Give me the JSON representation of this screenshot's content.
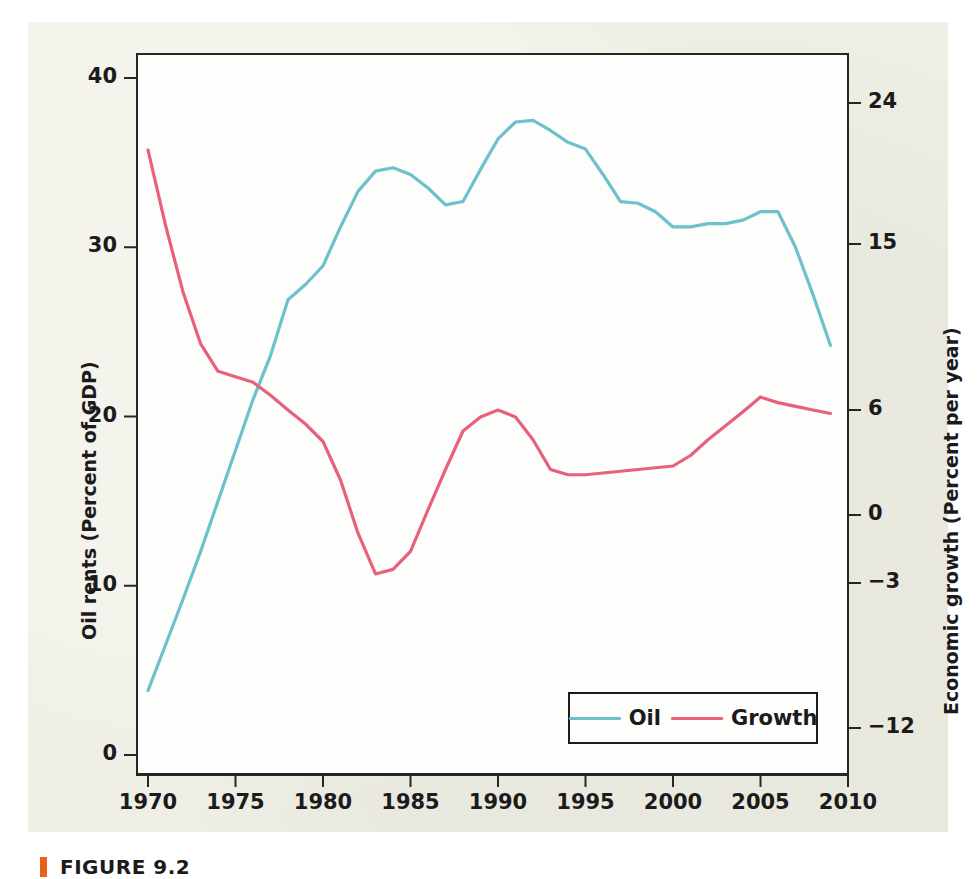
{
  "figure": {
    "caption_label": "FIGURE 9.2",
    "accent_color": "#e8601c",
    "page_background": "#efeee4",
    "plot_background": "#fdfdfb",
    "frame_color": "#262626"
  },
  "legend": {
    "position": "bottom-right-inside",
    "entries": [
      {
        "label": "Oil",
        "color": "#6cc1cd"
      },
      {
        "label": "Growth",
        "color": "#e8607a"
      }
    ]
  },
  "chart_data": {
    "type": "line",
    "title": "",
    "xlabel": "",
    "ylabel": "Oil rents (Percent of GDP)",
    "y2label": "Economic growth  (Percent per year)",
    "grid": false,
    "xlim": [
      1970,
      2010
    ],
    "xticks": [
      1970,
      1975,
      1980,
      1985,
      1990,
      1995,
      2000,
      2005,
      2010
    ],
    "xtick_labels": [
      "1970",
      "1975",
      "1980",
      "1985",
      "1990",
      "1995",
      "2000",
      "2005",
      "2010"
    ],
    "ylim": [
      0,
      40
    ],
    "yticks": [
      0,
      10,
      20,
      30,
      40
    ],
    "ytick_labels": [
      "0",
      "10",
      "20",
      "30",
      "40"
    ],
    "y2ticks": [
      -12,
      -3,
      0,
      6,
      15,
      24
    ],
    "y2tick_labels": [
      "−12",
      "−3",
      "0",
      "6",
      "15",
      "24"
    ],
    "y2tick_pixels": [
      728,
      583,
      515,
      410,
      244,
      103
    ],
    "legend_position": "lower right",
    "x": [
      1970,
      1971,
      1972,
      1973,
      1974,
      1975,
      1976,
      1977,
      1978,
      1979,
      1980,
      1981,
      1982,
      1983,
      1984,
      1985,
      1986,
      1987,
      1988,
      1989,
      1990,
      1991,
      1992,
      1993,
      1994,
      1995,
      1996,
      1997,
      1998,
      1999,
      2000,
      2001,
      2002,
      2003,
      2004,
      2005,
      2006,
      2007,
      2008,
      2009
    ],
    "series": [
      {
        "name": "Oil",
        "axis": "left",
        "units": "Percent of GDP",
        "color": "#6cc1cd",
        "values": [
          3.8,
          6.5,
          9.2,
          12.0,
          15.0,
          18.0,
          21.0,
          23.6,
          26.9,
          27.8,
          28.9,
          31.2,
          33.3,
          34.5,
          34.7,
          34.3,
          33.5,
          32.5,
          32.7,
          34.6,
          36.4,
          37.4,
          37.5,
          36.9,
          36.2,
          35.8,
          34.3,
          32.7,
          32.6,
          32.1,
          31.2,
          31.2,
          31.4,
          31.4,
          31.6,
          32.1,
          32.1,
          30.0,
          27.2,
          24.2
        ]
      },
      {
        "name": "Growth",
        "axis": "right",
        "units": "Percent per year",
        "color": "#e8607a",
        "values": [
          21.0,
          16.2,
          12.4,
          9.6,
          8.1,
          7.8,
          7.5,
          6.8,
          6.0,
          5.2,
          4.2,
          2.0,
          -0.8,
          -2.6,
          -2.4,
          -1.6,
          0.3,
          2.6,
          4.8,
          5.6,
          6.0,
          5.6,
          4.3,
          2.6,
          2.3,
          2.3,
          2.4,
          2.5,
          2.6,
          2.7,
          2.8,
          3.4,
          4.3,
          5.1,
          5.9,
          6.7,
          6.4,
          6.2,
          6.0,
          5.8
        ]
      }
    ]
  }
}
